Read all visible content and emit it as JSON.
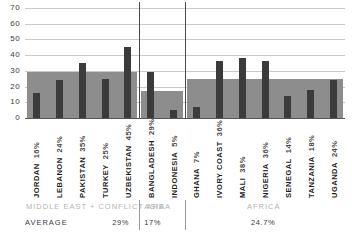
{
  "chart_data": {
    "type": "bar",
    "title": "",
    "xlabel": "",
    "ylabel": "",
    "ylim": [
      0,
      70
    ],
    "yticks": [
      0,
      10,
      20,
      30,
      40,
      50,
      60,
      70
    ],
    "grid": true,
    "legend": "none",
    "categories": [
      "JORDAN",
      "LEBANON",
      "PAKISTAN",
      "TURKEY",
      "UZBEKISTAN",
      "BANGLADESH",
      "INDONESIA",
      "GHANA",
      "IVORY COAST",
      "MALI",
      "NIGERIA",
      "SENEGAL",
      "TANZANIA",
      "UGANDA"
    ],
    "values": [
      16,
      24,
      35,
      25,
      45,
      29,
      5,
      7,
      36,
      38,
      36,
      14,
      18,
      24
    ],
    "value_labels": [
      "16%",
      "24%",
      "35%",
      "25%",
      "45%",
      "29%",
      "5%",
      "7%",
      "36%",
      "38%",
      "36%",
      "14%",
      "18%",
      "24%"
    ],
    "groups": [
      {
        "name": "MIDDLE EAST + CONFLICT AREA",
        "average": 29,
        "average_label": "29%",
        "start": 0,
        "count": 5
      },
      {
        "name": "ASIA",
        "average": 17,
        "average_label": "17%",
        "start": 5,
        "count": 2
      },
      {
        "name": "AFRICA",
        "average": 24.7,
        "average_label": "24.7%",
        "start": 7,
        "count": 7
      }
    ]
  },
  "footer": {
    "average_row_label": "AVERAGE"
  },
  "colors": {
    "bar": "#3b3b3b",
    "band": "#8d8d8d",
    "gridline": "#c9c9c9",
    "axis": "#555555",
    "region_text": "#b4b4b4",
    "label_text": "#1d1d1d"
  }
}
